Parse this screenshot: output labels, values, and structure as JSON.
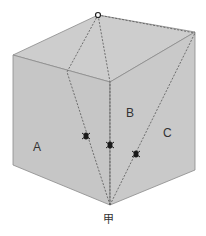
{
  "diagram": {
    "type": "cube-paths",
    "face_color": "#c9c9c9",
    "edge_color": "#8a8a8a",
    "path_color": "#555555",
    "marker_color": "#1a1a1a",
    "labels": {
      "face_a": "A",
      "face_b": "B",
      "face_c": "C",
      "start_vertex": "甲"
    },
    "paths": [
      {
        "name": "path-via-A",
        "marker": "bug"
      },
      {
        "name": "path-via-B",
        "marker": "bug"
      },
      {
        "name": "path-via-C",
        "marker": "bug"
      }
    ]
  }
}
